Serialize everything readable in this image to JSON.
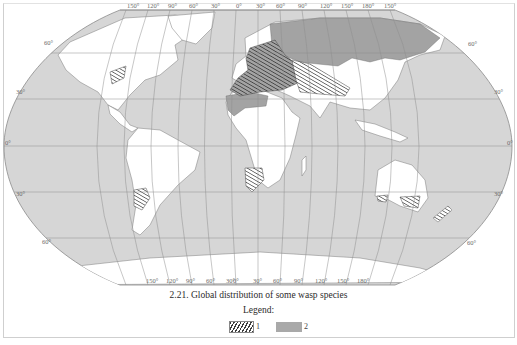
{
  "caption": "2.21. Global distribution of some wasp species",
  "legend": {
    "title": "Legend:",
    "items": [
      {
        "label": "1",
        "pattern": "hatched"
      },
      {
        "label": "2",
        "pattern": "solid-gray"
      }
    ]
  },
  "map": {
    "projection": "pseudocylindrical world map",
    "longitude_labels_top": [
      "150°",
      "120°",
      "90°",
      "60°",
      "30°",
      "0°",
      "30°",
      "60°",
      "90°",
      "120°",
      "150°",
      "180°",
      "150°"
    ],
    "longitude_labels_bottom": [
      "150°",
      "120°",
      "90°",
      "60°",
      "30°",
      "0°",
      "30°",
      "60°",
      "90°",
      "120°",
      "150°",
      "180°",
      "150°"
    ],
    "latitude_labels_left": [
      "60°",
      "30°",
      "0°",
      "30°",
      "60°"
    ],
    "latitude_labels_right": [
      "60°",
      "30°",
      "0°",
      "30°",
      "60°"
    ],
    "colors": {
      "ocean": "#d6d6d6",
      "land": "#ffffff",
      "range_2": "#a3a3a3",
      "hatch": "#3a3a3a",
      "grid": "#8e8e8e"
    }
  }
}
